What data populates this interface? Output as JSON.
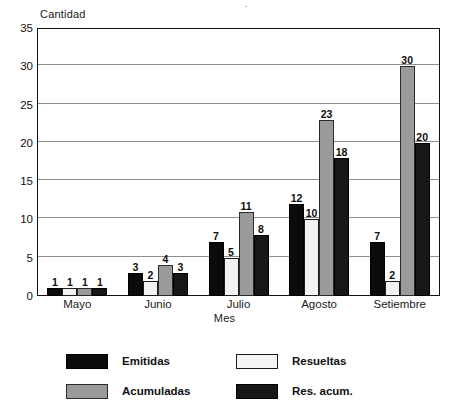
{
  "title_partial": "mensual",
  "chart_data": {
    "type": "bar",
    "title": "mensual",
    "xlabel": "Mes",
    "ylabel": "Cantidad",
    "categories": [
      "Mayo",
      "Junio",
      "Julio",
      "Agosto",
      "Setiembre"
    ],
    "series": [
      {
        "name": "Emitidas",
        "color": "#0b0b0b",
        "values": [
          1,
          3,
          7,
          12,
          7
        ]
      },
      {
        "name": "Resueltas",
        "color": "#f2f2f0",
        "values": [
          1,
          2,
          5,
          10,
          2
        ]
      },
      {
        "name": "Acumuladas",
        "color": "#9a9a9a",
        "values": [
          1,
          4,
          11,
          23,
          30
        ]
      },
      {
        "name": "Res. acum.",
        "color": "#171717",
        "values": [
          1,
          3,
          8,
          18,
          20
        ]
      }
    ],
    "ylim": [
      0,
      35
    ],
    "yticks": [
      0,
      5,
      10,
      15,
      20,
      25,
      30,
      35
    ],
    "gridlines": [
      5,
      10,
      15,
      20,
      25,
      30
    ],
    "grid": true,
    "legend_position": "bottom",
    "data_labels": true
  }
}
